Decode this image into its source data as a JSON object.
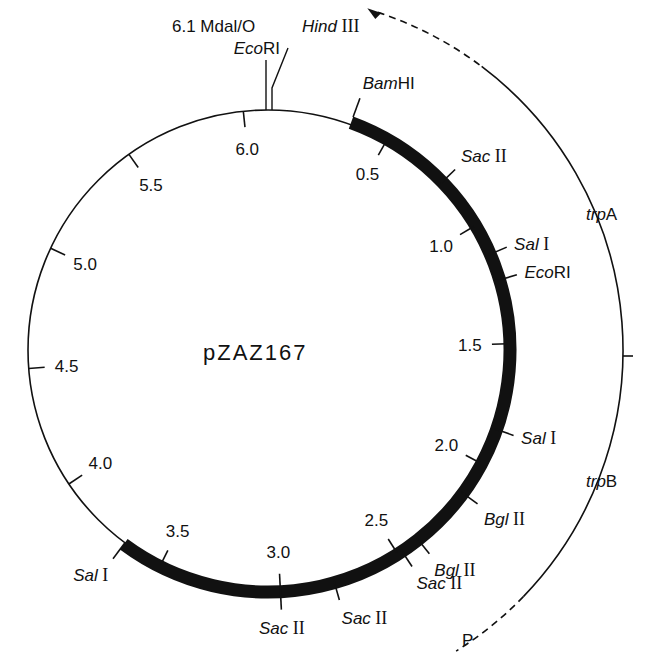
{
  "plasmid": {
    "name": "pZAZ167",
    "total_kb": 6.1,
    "start_label": "6.1 MdaI/O",
    "start_label_display": "6.1 Mdal/O",
    "origin_site": {
      "italic": "Eco",
      "roman": "RI"
    }
  },
  "scale_ticks": [
    {
      "kb": 0.5,
      "label": "0.5"
    },
    {
      "kb": 1.0,
      "label": "1.0"
    },
    {
      "kb": 1.5,
      "label": "1.5"
    },
    {
      "kb": 2.0,
      "label": "2.0"
    },
    {
      "kb": 2.5,
      "label": "2.5"
    },
    {
      "kb": 3.0,
      "label": "3.0"
    },
    {
      "kb": 3.5,
      "label": "3.5"
    },
    {
      "kb": 4.0,
      "label": "4.0"
    },
    {
      "kb": 4.5,
      "label": "4.5"
    },
    {
      "kb": 5.0,
      "label": "5.0"
    },
    {
      "kb": 5.5,
      "label": "5.5"
    },
    {
      "kb": 6.0,
      "label": "6.0"
    }
  ],
  "insert": {
    "start_kb": 0.34,
    "end_kb": 3.67,
    "description": "bold insert segment"
  },
  "restriction_sites": [
    {
      "kb": 0.03,
      "italic": "Hind",
      "roman": " III"
    },
    {
      "kb": 0.34,
      "italic": "Bam",
      "roman": "HI"
    },
    {
      "kb": 0.78,
      "italic": "Sac",
      "roman": " II"
    },
    {
      "kb": 1.13,
      "italic": "Sal",
      "roman": " I"
    },
    {
      "kb": 1.24,
      "italic": "Eco",
      "roman": "RI"
    },
    {
      "kb": 1.85,
      "italic": "Sal",
      "roman": " I"
    },
    {
      "kb": 2.14,
      "italic": "Bgl",
      "roman": " II"
    },
    {
      "kb": 2.4,
      "italic": "Bgl",
      "roman": " II"
    },
    {
      "kb": 2.48,
      "italic": "Sac",
      "roman": " II"
    },
    {
      "kb": 2.78,
      "italic": "Sac",
      "roman": " II"
    },
    {
      "kb": 3.0,
      "italic": "Sac",
      "roman": " II"
    },
    {
      "kb": 3.67,
      "italic": "Sal",
      "roman": " I"
    }
  ],
  "genes": [
    {
      "name": "trpA",
      "italic": "trp",
      "roman": "A"
    },
    {
      "name": "trpB",
      "italic": "trp",
      "roman": "B"
    }
  ],
  "promoter": {
    "label": "P"
  },
  "colors": {
    "line": "#111111",
    "background": "#ffffff"
  }
}
